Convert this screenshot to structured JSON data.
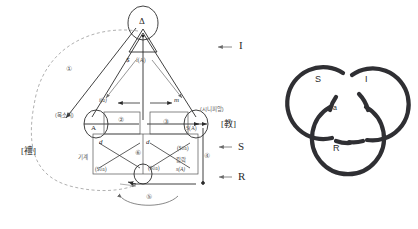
{
  "figure": {
    "colors": {
      "ink": "#2b2b2b",
      "light_ink": "#6a6a6a",
      "knot": "#2f2f33",
      "background": "#ffffff"
    }
  },
  "graph": {
    "top_node": {
      "symbol": "Δ",
      "name": "delta-node"
    },
    "nodes": [
      {
        "id": "A",
        "label": "A",
        "sublabel": "(목소리)"
      },
      {
        "id": "SA",
        "label": "S(A)",
        "sublabel": "(시니피앙)"
      },
      {
        "id": "bottom",
        "label": ""
      }
    ],
    "arrow_labels": [
      {
        "id": "i-a",
        "text": "i(a)"
      },
      {
        "id": "m",
        "text": "m"
      },
      {
        "id": "dollar",
        "text": "$"
      },
      {
        "id": "fA",
        "text": "f(A)"
      },
      {
        "id": "d-left",
        "text": "d"
      },
      {
        "id": "d-right",
        "text": "d"
      }
    ],
    "korean_labels": [
      {
        "id": "voice",
        "text": "(목소리)"
      },
      {
        "id": "signifier",
        "text": "(시니피앙)"
      },
      {
        "id": "machine",
        "text": "기계"
      },
      {
        "id": "pleasure",
        "text": "캌락"
      }
    ],
    "matheme_labels": [
      {
        "id": "phi-a-left",
        "text": "($◊a)"
      },
      {
        "id": "phi-a-mid",
        "text": "($◊a)"
      },
      {
        "id": "phi-a-right",
        "text": "($◊a)"
      },
      {
        "id": "s-of-A",
        "text": "s(A)"
      }
    ],
    "steps": [
      "①",
      "②",
      "③",
      "④",
      "⑤",
      "⑥"
    ],
    "bracket_labels": [
      {
        "id": "li",
        "text": "[禮]"
      },
      {
        "id": "gyo",
        "text": "[教]"
      }
    ],
    "register_arrows": [
      {
        "id": "I",
        "arrow": "←",
        "text": "I"
      },
      {
        "id": "S",
        "arrow": "←",
        "text": "S"
      },
      {
        "id": "R",
        "arrow": "←",
        "text": "R"
      }
    ]
  },
  "knot": {
    "name": "borromean-knot",
    "rings": [
      {
        "id": "S",
        "label": "S"
      },
      {
        "id": "I",
        "label": "I"
      },
      {
        "id": "R",
        "label": "R"
      }
    ],
    "center_label": "a"
  }
}
